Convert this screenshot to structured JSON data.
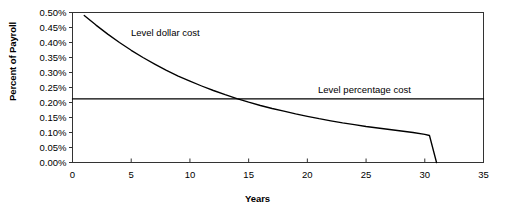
{
  "chart_data": {
    "type": "line",
    "title": "",
    "xlabel": "Years",
    "ylabel": "Percent of Payroll",
    "xlim": [
      0,
      35
    ],
    "ylim": [
      0,
      0.005
    ],
    "grid": false,
    "legend_position": "inline-annotations",
    "x_ticks": [
      "0",
      "5",
      "10",
      "15",
      "20",
      "25",
      "30",
      "35"
    ],
    "x_tick_values": [
      0,
      5,
      10,
      15,
      20,
      25,
      30,
      35
    ],
    "y_ticks": [
      "0.00%",
      "0.05%",
      "0.10%",
      "0.15%",
      "0.20%",
      "0.25%",
      "0.30%",
      "0.35%",
      "0.40%",
      "0.45%",
      "0.50%"
    ],
    "y_tick_values": [
      0.0,
      0.0005,
      0.001,
      0.0015,
      0.002,
      0.0025,
      0.003,
      0.0035,
      0.004,
      0.0045,
      0.005
    ],
    "annotations": [
      {
        "name": "level-dollar-cost",
        "text": "Level dollar cost"
      },
      {
        "name": "level-percentage-cost",
        "text": "Level percentage cost"
      }
    ],
    "series": [
      {
        "name": "Level dollar cost",
        "color": "#000000",
        "x": [
          1,
          2,
          3,
          4,
          5,
          6,
          7,
          8,
          9,
          10,
          11,
          12,
          13,
          14,
          15,
          16,
          17,
          18,
          19,
          20,
          21,
          22,
          23,
          24,
          25,
          26,
          27,
          28,
          29,
          30,
          30.4,
          31
        ],
        "y": [
          0.0049,
          0.00458,
          0.00428,
          0.004,
          0.00374,
          0.0035,
          0.00328,
          0.00307,
          0.00288,
          0.00271,
          0.00255,
          0.0024,
          0.00226,
          0.00213,
          0.00201,
          0.0019,
          0.0018,
          0.00171,
          0.00162,
          0.00154,
          0.00146,
          0.00139,
          0.00132,
          0.00126,
          0.0012,
          0.00115,
          0.0011,
          0.00105,
          0.001,
          0.00094,
          0.0009,
          0.0
        ]
      },
      {
        "name": "Level percentage cost",
        "color": "#000000",
        "x": [
          0,
          35
        ],
        "y": [
          0.00212,
          0.00212
        ]
      }
    ],
    "crossing_point": {
      "x": 11.7,
      "y": 0.00212
    }
  },
  "axes": {
    "y_title": "Percent of Payroll",
    "x_title": "Years"
  }
}
